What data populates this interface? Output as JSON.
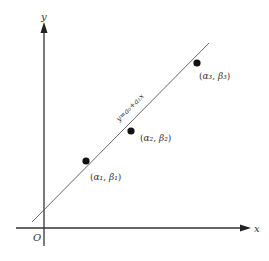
{
  "diagram": {
    "axes": {
      "x_label": "x",
      "y_label": "y",
      "origin_label": "O"
    },
    "fit_line": {
      "equation_label": "y=a₀+a₁x"
    },
    "points": [
      {
        "label_open": "(",
        "label_a": "α₁",
        "label_sep": ",  ",
        "label_b": "β₁",
        "label_close": ")"
      },
      {
        "label_open": "(",
        "label_a": "α₂",
        "label_sep": ",  ",
        "label_b": "β₂",
        "label_close": ")"
      },
      {
        "label_open": "(",
        "label_a": "α₃",
        "label_sep": ",  ",
        "label_b": "β₃",
        "label_close": ")"
      }
    ]
  }
}
